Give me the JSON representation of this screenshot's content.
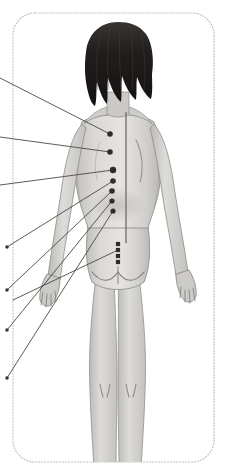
{
  "panel": {
    "title": "Posterior Body Acupuncture Point Diagram",
    "background_color": "#ffffff",
    "border": {
      "style": "dotted",
      "color": "#b9b9b9",
      "x": 13,
      "y": 13,
      "width": 201,
      "height": 449,
      "corner_radius": 22
    }
  },
  "figure": {
    "name": "female-posterior-body",
    "view": "posterior",
    "skin_color": "#d9d7d3",
    "skin_shadow_color": "#b5b3ae",
    "outline_color": "#8e8c88",
    "hair_color": "#231f1e"
  },
  "spine": {
    "name": "spinal-midline",
    "color": "#6f6d6a",
    "x": 126,
    "y_top": 112,
    "y_bottom": 243
  },
  "points": [
    {
      "id": "p1",
      "label": "point-1",
      "x": 110,
      "y": 134,
      "r": 2.8
    },
    {
      "id": "p2",
      "label": "point-2",
      "x": 110,
      "y": 152,
      "r": 2.8
    },
    {
      "id": "p3",
      "label": "point-3",
      "x": 113,
      "y": 170,
      "r": 3.2
    },
    {
      "id": "p4",
      "label": "point-4",
      "x": 113,
      "y": 181,
      "r": 2.8
    },
    {
      "id": "p5",
      "label": "point-5",
      "x": 112,
      "y": 191,
      "r": 2.8
    },
    {
      "id": "p6",
      "label": "point-6",
      "x": 112,
      "y": 201,
      "r": 2.6
    },
    {
      "id": "p7",
      "label": "point-7",
      "x": 113,
      "y": 211,
      "r": 2.6
    }
  ],
  "sacral_points": {
    "name": "sacral-foramina-points",
    "x": 118,
    "y_values": [
      244,
      250,
      256,
      262
    ],
    "size": 4.2,
    "color": "#2f2d2c"
  },
  "leader_lines": [
    {
      "id": "l1",
      "x1": 0,
      "y1": 78,
      "x2": 110,
      "y2": 134,
      "terminal": "edge"
    },
    {
      "id": "l2",
      "x1": 0,
      "y1": 137,
      "x2": 110,
      "y2": 152,
      "terminal": "edge"
    },
    {
      "id": "l3",
      "x1": 0,
      "y1": 185,
      "x2": 113,
      "y2": 170,
      "terminal": "edge"
    },
    {
      "id": "l4",
      "x1": 7,
      "y1": 247,
      "x2": 113,
      "y2": 181,
      "terminal": "dot"
    },
    {
      "id": "l5",
      "x1": 7,
      "y1": 290,
      "x2": 112,
      "y2": 191,
      "terminal": "dot"
    },
    {
      "id": "l6",
      "x1": 7,
      "y1": 330,
      "x2": 112,
      "y2": 201,
      "terminal": "dot"
    },
    {
      "id": "l7",
      "x1": 7,
      "y1": 378,
      "x2": 113,
      "y2": 211,
      "terminal": "dot"
    },
    {
      "id": "l8",
      "x1": 13,
      "y1": 300,
      "x2": 118,
      "y2": 250,
      "terminal": "none"
    }
  ],
  "line_style": {
    "color": "#4a4846",
    "width": 0.9,
    "dot_radius": 1.8
  }
}
